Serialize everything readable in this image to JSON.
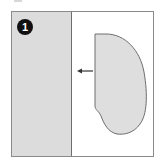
{
  "step": {
    "number": "1"
  },
  "colors": {
    "strip_fill": "#dcdcdc",
    "shape_fill": "#dedede",
    "outline": "#6e6e6e",
    "badge": "#111111",
    "arrow": "#333333"
  }
}
